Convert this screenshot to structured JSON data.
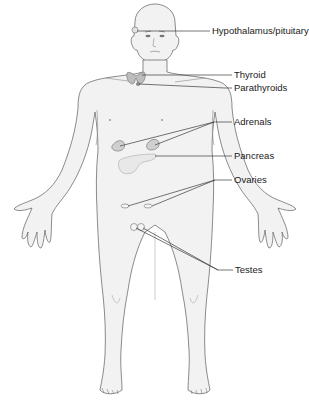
{
  "diagram": {
    "colors": {
      "background": "#ffffff",
      "body_fill": "#f2f2f2",
      "body_outline": "#6e6e6e",
      "gland_fill": "#c9c9c9",
      "leader_line": "#3a3a3a",
      "label_text": "#1a1a1a"
    },
    "labels": [
      {
        "id": "hypothalamus",
        "text": "Hypothalamus/pituitary",
        "x": 212,
        "y": 26
      },
      {
        "id": "thyroid",
        "text": "Thyroid",
        "x": 234,
        "y": 70
      },
      {
        "id": "parathyroids",
        "text": "Parathyroids",
        "x": 234,
        "y": 84
      },
      {
        "id": "adrenals",
        "text": "Adrenals",
        "x": 234,
        "y": 117
      },
      {
        "id": "pancreas",
        "text": "Pancreas",
        "x": 234,
        "y": 151
      },
      {
        "id": "ovaries",
        "text": "Ovaries",
        "x": 234,
        "y": 176
      },
      {
        "id": "testes",
        "text": "Testes",
        "x": 235,
        "y": 266
      }
    ]
  }
}
